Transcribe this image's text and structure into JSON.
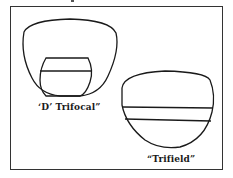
{
  "figure": {
    "lenses": [
      {
        "id": "d-trifocal",
        "label": "‘D’ Trifocal”"
      },
      {
        "id": "trifield",
        "label": "“Trifield”"
      }
    ]
  },
  "colors": {
    "stroke": "#1a1a1a",
    "frame": "#333333",
    "background": "#ffffff"
  }
}
